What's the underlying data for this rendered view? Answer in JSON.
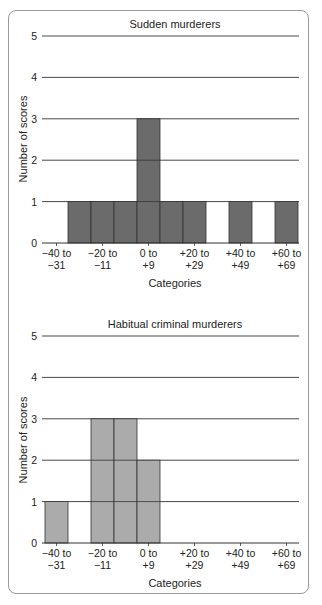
{
  "chart_data": [
    {
      "type": "bar",
      "title": "Sudden murderers",
      "xlabel": "Categories",
      "ylabel": "Number of scores",
      "ylim": [
        0,
        5
      ],
      "yticks": [
        0,
        1,
        2,
        3,
        4,
        5
      ],
      "grid": true,
      "bar_color": "#6b6b6b",
      "bins": [
        "-40 to -31",
        "-30 to -21",
        "-20 to -11",
        "-10 to -1",
        "0 to +9",
        "+10 to +19",
        "+20 to +29",
        "+30 to +39",
        "+40 to +49",
        "+50 to +59",
        "+60 to +69"
      ],
      "values": [
        0,
        1,
        1,
        1,
        3,
        1,
        1,
        0,
        1,
        0,
        1
      ],
      "tick_labels": [
        {
          "bin": 0,
          "line1": "−40 to",
          "line2": "−31"
        },
        {
          "bin": 2,
          "line1": "−20 to",
          "line2": "−11"
        },
        {
          "bin": 4,
          "line1": "0 to",
          "line2": "+9"
        },
        {
          "bin": 6,
          "line1": "+20 to",
          "line2": "+29"
        },
        {
          "bin": 8,
          "line1": "+40 to",
          "line2": "+49"
        },
        {
          "bin": 10,
          "line1": "+60 to",
          "line2": "+69"
        }
      ]
    },
    {
      "type": "bar",
      "title": "Habitual criminal murderers",
      "xlabel": "Categories",
      "ylabel": "Number of scores",
      "ylim": [
        0,
        5
      ],
      "yticks": [
        0,
        1,
        2,
        3,
        4,
        5
      ],
      "grid": true,
      "bar_color": "#ababab",
      "bins": [
        "-40 to -31",
        "-30 to -21",
        "-20 to -11",
        "-10 to -1",
        "0 to +9",
        "+10 to +19",
        "+20 to +29",
        "+30 to +39",
        "+40 to +49",
        "+50 to +59",
        "+60 to +69"
      ],
      "values": [
        1,
        0,
        3,
        3,
        2,
        0,
        0,
        0,
        0,
        0,
        0
      ],
      "tick_labels": [
        {
          "bin": 0,
          "line1": "−40 to",
          "line2": "−31"
        },
        {
          "bin": 2,
          "line1": "−20 to",
          "line2": "−11"
        },
        {
          "bin": 4,
          "line1": "0 to",
          "line2": "+9"
        },
        {
          "bin": 6,
          "line1": "+20 to",
          "line2": "+29"
        },
        {
          "bin": 8,
          "line1": "+40 to",
          "line2": "+49"
        },
        {
          "bin": 10,
          "line1": "+60 to",
          "line2": "+69"
        }
      ]
    }
  ]
}
